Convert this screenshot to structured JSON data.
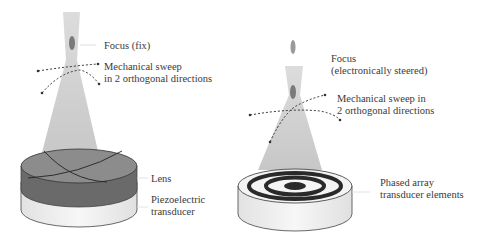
{
  "left_panel": {
    "title": "Mechanically swept single-element transducer",
    "focus_label": "Focus (fix)",
    "sweep_label_line1": "Mechanical sweep",
    "sweep_label_line2": "in 2 orthogonal directions",
    "lens_label": "Lens",
    "transducer_label_line1": "Piezoelectric",
    "transducer_label_line2": "transducer"
  },
  "right_panel": {
    "title": "Mechanically swept phased array transducer",
    "focus_label_line1": "Focus",
    "focus_label_line2": "(electronically steered)",
    "sweep_label_line1": "Mechanical sweep in",
    "sweep_label_line2": "2 orthogonal directions",
    "array_label_line1": "Phased array",
    "array_label_line2": "transducer elements"
  },
  "colors": {
    "beam": "#c8c8c8",
    "focus_spot": "#7a7a7a",
    "lens_top": "#8a8a8a",
    "lens_side": "#6a6a6a",
    "transducer_side": "#efefef",
    "ring_dark": "#2a2a2a",
    "text": "#3a3a3a"
  }
}
